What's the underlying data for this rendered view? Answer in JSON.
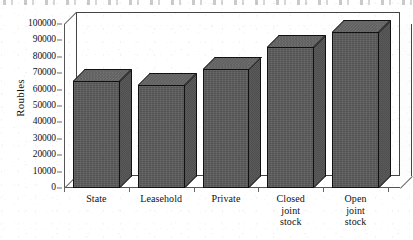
{
  "chart_data": {
    "type": "bar",
    "title": "",
    "subtitle": "",
    "xlabel": "",
    "ylabel": "Roubles",
    "categories": [
      "State",
      "Leasehold",
      "Private",
      "Closed\njoint\nstock",
      "Open\njoint\nstock"
    ],
    "category_labels_flat": [
      "State",
      "Leasehold",
      "Private",
      "Closed joint stock",
      "Open joint stock"
    ],
    "values": [
      65000,
      63000,
      72500,
      86000,
      95000
    ],
    "ylim": [
      0,
      100000
    ],
    "ytick_step": 10000,
    "ytick_labels": [
      "100000",
      "90000",
      "80000",
      "70000",
      "60000",
      "50000",
      "40000",
      "30000",
      "20000",
      "10000",
      "0"
    ],
    "ytick_values": [
      100000,
      90000,
      80000,
      70000,
      60000,
      50000,
      40000,
      30000,
      20000,
      10000,
      0
    ],
    "grid": false,
    "legend": null,
    "legend_position": "none",
    "style": "3d-bar",
    "annotations": []
  },
  "colors": {
    "background": "#ffffff",
    "bar_front": "#5c5c5c",
    "bar_top": "#676767",
    "bar_side": "#545454",
    "bar_edge": "#111111",
    "axis": "#555555",
    "frame": "#444444",
    "text": "#111111"
  }
}
